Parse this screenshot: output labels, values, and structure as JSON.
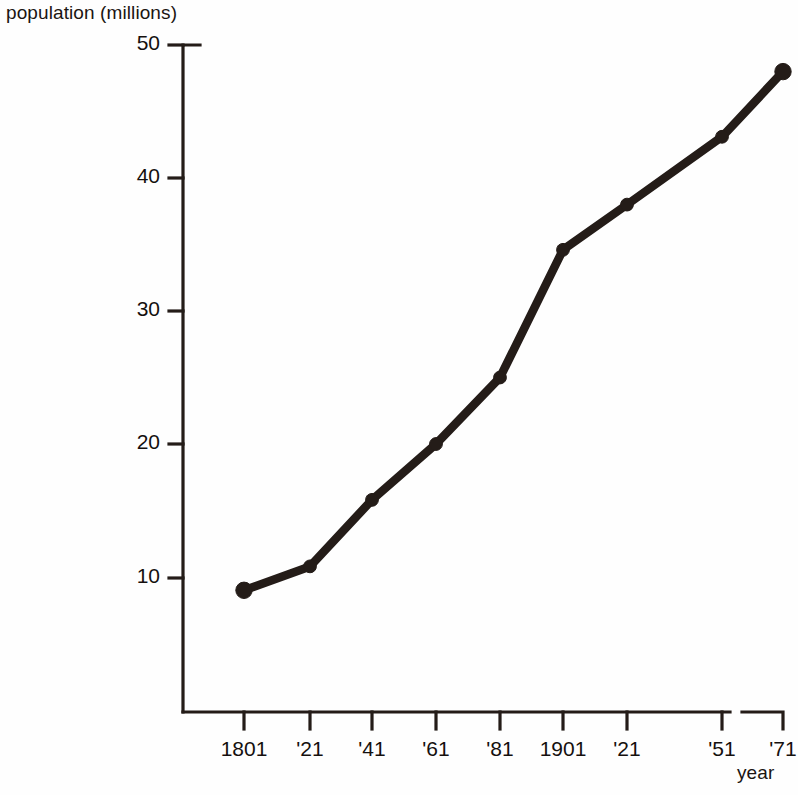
{
  "chart_data": {
    "type": "line",
    "title": "",
    "xlabel": "year",
    "ylabel": "population (millions)",
    "categories": [
      "1801",
      "'21",
      "'41",
      "'61",
      "'81",
      "1901",
      "'21",
      "'51",
      "'71"
    ],
    "x_values": [
      1801,
      1821,
      1841,
      1861,
      1881,
      1901,
      1921,
      1951,
      1971
    ],
    "values": [
      9.0,
      10.8,
      15.8,
      20.0,
      25.0,
      34.6,
      38.0,
      43.1,
      48.0
    ],
    "series": [
      {
        "name": "population",
        "values": [
          9.0,
          10.8,
          15.8,
          20.0,
          25.0,
          34.6,
          38.0,
          43.1,
          48.0
        ]
      }
    ],
    "ylim": [
      0,
      50
    ],
    "y_ticks": [
      10,
      20,
      30,
      40,
      50
    ],
    "y_tick_labels": [
      "10",
      "20",
      "30",
      "40",
      "50"
    ],
    "x_tick_labels": [
      "1801",
      "'21",
      "'41",
      "'61",
      "'81",
      "1901",
      "'21",
      "'51",
      "'71"
    ],
    "grid": false,
    "legend": false,
    "legend_position": "none",
    "marker": "circle",
    "line_color": "#241c18",
    "marker_color": "#241c18",
    "axis_color": "#241c18",
    "background_color": "#ffffff",
    "axis_break_between": [
      "'51",
      "'71"
    ],
    "annotations": []
  },
  "labels": {
    "y_axis_title": "population (millions)",
    "x_axis_title": "year"
  },
  "geometry": {
    "plot_left": 183,
    "plot_bottom": 712,
    "plot_right": 790,
    "y_top_value": 50,
    "y_top_pixel": 45,
    "pixels_per_unit": 13.3,
    "tick_x_pixels": [
      244,
      310,
      372,
      436,
      500,
      563,
      627,
      722,
      783
    ],
    "tick_y_pixels": [
      578,
      444,
      311,
      178,
      45
    ]
  }
}
